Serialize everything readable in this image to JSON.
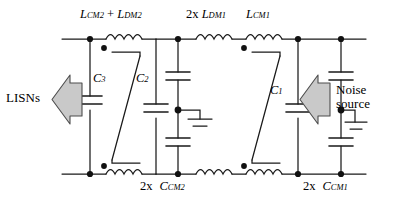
{
  "figure": {
    "type": "circuit-schematic",
    "colors": {
      "wire": "#1a1a1a",
      "node": "#111111",
      "arrow_fill": "#c9c9c9",
      "arrow_stroke": "#4d4d4d",
      "background": "#ffffff"
    }
  },
  "labels": {
    "inductor_top_left": {
      "main": "L",
      "sub": "CM2",
      "op": " + ",
      "main2": "L",
      "sub2": "DM2"
    },
    "inductor_top_mid": {
      "prefix": "2x ",
      "main": "L",
      "sub": "DM1"
    },
    "inductor_top_right": {
      "main": "L",
      "sub": "CM1"
    },
    "cap_c3": {
      "main": "C",
      "sub": "3"
    },
    "cap_c2": {
      "main": "C",
      "sub": "2"
    },
    "cap_c1": {
      "main": "C",
      "sub": "1"
    },
    "cap_ccm2": {
      "prefix": "2x",
      "main": "C",
      "sub": "CM2"
    },
    "cap_ccm1": {
      "prefix": "2x",
      "main": "C",
      "sub": "CM1"
    },
    "left_port": "LISNs",
    "right_port_line1": "Noise",
    "right_port_line2": "source"
  }
}
